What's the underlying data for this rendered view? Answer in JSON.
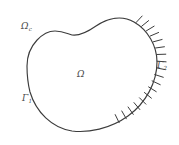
{
  "figure": {
    "name": "domain-boundary-diagram",
    "background_color": "#ffffff",
    "stroke_color": "#3c3c3c",
    "label_color": "#4a4a4a",
    "width": 179,
    "height": 145
  },
  "labels": {
    "interior_domain": {
      "symbol": "Ω",
      "subscript": "",
      "description": "interior-domain-label"
    },
    "notch_domain": {
      "symbol": "Ω",
      "subscript": "c",
      "description": "notch-subdomain-label"
    },
    "boundary_one": {
      "symbol": "Γ",
      "subscript": "1",
      "description": "free-boundary-label"
    },
    "boundary_two": {
      "symbol": "Γ",
      "subscript": "2",
      "description": "hatched-boundary-label"
    }
  },
  "geometry": {
    "outline_path": "M 27,66 C 27,44 44,31 55,31 C 63,31 68,34 72,35 C 79,36 86,33 96,26 C 108,18 122,15 134,22 C 148,30 157,46 157,62 C 157,82 146,103 128,116 C 110,129 88,133 72,131 C 52,128 36,112 30,92 C 28,84 27,74 27,66 Z",
    "notch_description": "concave V-shaped indentation on the upper-left arc",
    "hatch_side": "right",
    "hatch_count": 18,
    "hatch_length": 9
  },
  "hatch_marks": [
    {
      "x": 136.0,
      "y": 22.6,
      "angle": -47
    },
    {
      "x": 141.6,
      "y": 26.3,
      "angle": -39
    },
    {
      "x": 146.4,
      "y": 30.8,
      "angle": -31
    },
    {
      "x": 150.3,
      "y": 36.0,
      "angle": -23
    },
    {
      "x": 153.4,
      "y": 41.8,
      "angle": -15
    },
    {
      "x": 155.5,
      "y": 48.0,
      "angle": -8
    },
    {
      "x": 156.8,
      "y": 54.5,
      "angle": -2
    },
    {
      "x": 157.1,
      "y": 61.2,
      "angle": 4
    },
    {
      "x": 156.4,
      "y": 67.9,
      "angle": 11
    },
    {
      "x": 154.7,
      "y": 74.5,
      "angle": 18
    },
    {
      "x": 152.1,
      "y": 80.9,
      "angle": 25
    },
    {
      "x": 148.6,
      "y": 86.9,
      "angle": 32
    },
    {
      "x": 144.4,
      "y": 92.5,
      "angle": 39
    },
    {
      "x": 139.5,
      "y": 97.8,
      "angle": 45
    },
    {
      "x": 134.0,
      "y": 102.6,
      "angle": 50
    },
    {
      "x": 128.1,
      "y": 107.0,
      "angle": 55
    },
    {
      "x": 121.8,
      "y": 111.0,
      "angle": 60
    },
    {
      "x": 115.2,
      "y": 114.6,
      "angle": 64
    }
  ]
}
